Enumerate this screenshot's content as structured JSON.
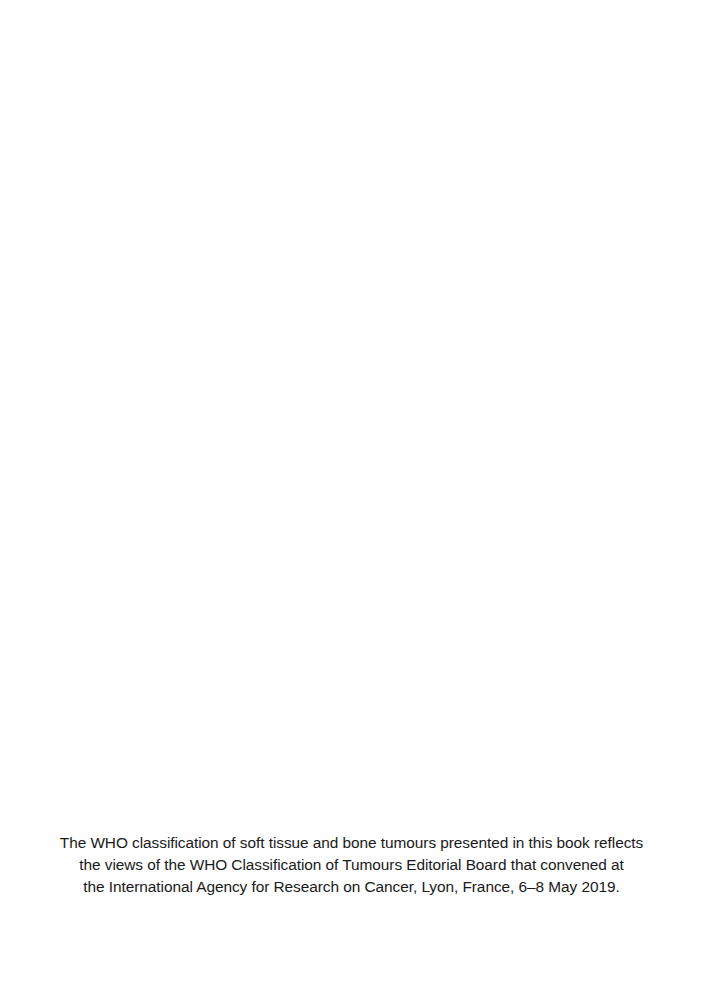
{
  "document": {
    "statement": {
      "lines": [
        "The WHO classification of soft tissue and bone tumours presented in this book reflects",
        "the views of the WHO Classification of Tumours Editorial Board that convened at",
        "the International Agency for Research on Cancer, Lyon, France, 6–8 May 2019."
      ]
    }
  }
}
